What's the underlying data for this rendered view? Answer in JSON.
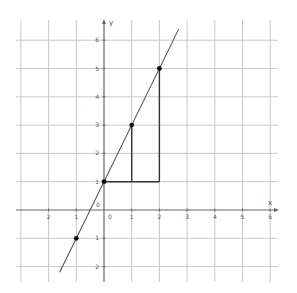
{
  "chart_data": {
    "type": "line",
    "title": "",
    "xlabel": "x",
    "ylabel": "y",
    "xlim": [
      -3.0,
      6.5
    ],
    "ylim": [
      -2.8,
      6.5
    ],
    "grid": true,
    "x_tick_labels": [
      "2",
      "1",
      "0",
      "1",
      "2",
      "3",
      "4",
      "5",
      "6"
    ],
    "x_tick_values": [
      -2,
      -1,
      0,
      1,
      2,
      3,
      4,
      5,
      6
    ],
    "y_tick_labels": [
      "6",
      "5",
      "4",
      "3",
      "2",
      "1",
      "0",
      "1",
      "2"
    ],
    "y_tick_values": [
      6,
      5,
      4,
      3,
      2,
      1,
      0,
      -1,
      -2
    ],
    "origin_label": "0",
    "series": [
      {
        "name": "y = 2x + 1",
        "x_start": -1.6,
        "x_end": 2.7,
        "slope": 2,
        "intercept": 1
      }
    ],
    "points": [
      {
        "x": -1,
        "y": -1
      },
      {
        "x": 0,
        "y": 1
      },
      {
        "x": 1,
        "y": 3
      },
      {
        "x": 2,
        "y": 5
      }
    ],
    "annotations": [
      {
        "type": "segment",
        "from": [
          0,
          1
        ],
        "to": [
          2,
          1
        ],
        "desc": "horizontal run"
      },
      {
        "type": "segment",
        "from": [
          1,
          1
        ],
        "to": [
          1,
          3
        ],
        "desc": "rise at x=1"
      },
      {
        "type": "segment",
        "from": [
          2,
          1
        ],
        "to": [
          2,
          5
        ],
        "desc": "rise at x=2"
      }
    ]
  },
  "colors": {
    "grid": "#c8c8c8",
    "axis": "#666666",
    "line": "#555555",
    "point": "#111111",
    "segment": "#333333"
  }
}
